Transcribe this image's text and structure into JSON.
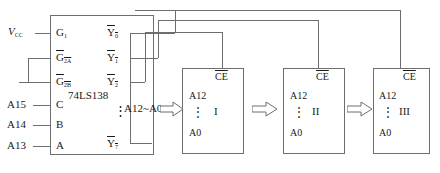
{
  "diagram": {
    "colors": {
      "wire": "#6e6e6e",
      "text": "#1a1a1a",
      "background": "#ffffff"
    }
  },
  "decoder": {
    "part_number": "74LS138",
    "inputs": [
      {
        "pin": "G",
        "sub": "1",
        "overline": false,
        "signal": "V",
        "signal_sub": "CC"
      },
      {
        "pin": "G",
        "sub": "2A",
        "overline": true,
        "signal": "GND"
      },
      {
        "pin": "G",
        "sub": "2B",
        "overline": true,
        "signal": "GND"
      },
      {
        "pin": "C",
        "sub": "",
        "overline": false,
        "signal": "A15"
      },
      {
        "pin": "B",
        "sub": "",
        "overline": false,
        "signal": "A14"
      },
      {
        "pin": "A",
        "sub": "",
        "overline": false,
        "signal": "A13"
      }
    ],
    "outputs": [
      {
        "pin": "Y",
        "sub": "0",
        "overline": true
      },
      {
        "pin": "Y",
        "sub": "1",
        "overline": true
      },
      {
        "pin": "Y",
        "sub": "2",
        "overline": true
      },
      {
        "pin": "Y",
        "sub": "7",
        "overline": true
      }
    ],
    "output_ellipsis": "⋮",
    "supply_label": "V",
    "supply_sub": "CC"
  },
  "bus": {
    "label": "A12~A0"
  },
  "memory_blocks": [
    {
      "name": "I",
      "top_pin": "CE",
      "addr_top": "A12",
      "addr_bottom": "A0",
      "ellipsis": "⋮"
    },
    {
      "name": "II",
      "top_pin": "CE",
      "addr_top": "A12",
      "addr_bottom": "A0",
      "ellipsis": "⋮"
    },
    {
      "name": "III",
      "top_pin": "CE",
      "addr_top": "A12",
      "addr_bottom": "A0",
      "ellipsis": "⋮"
    }
  ]
}
